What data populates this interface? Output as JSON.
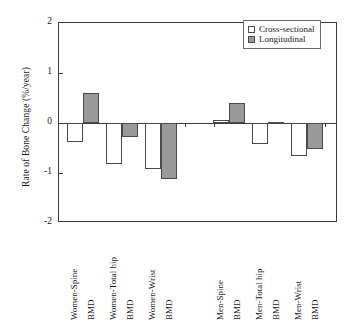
{
  "chart_data": {
    "type": "bar",
    "title": "",
    "xlabel": "",
    "ylabel": "Rate of Bone Change (%/year)",
    "ylim": [
      -2,
      2
    ],
    "yticks": [
      2,
      1,
      0,
      -1,
      -2
    ],
    "ytick_labels": [
      "2",
      "1",
      "0",
      "-1",
      "-2"
    ],
    "grid": false,
    "legend_position": "top-right",
    "categories": [
      "Women-Spine BMD",
      "Women-Total hip BMD",
      "Women-Wrist BMD",
      "Men-Spine BMD",
      "Men-Total hip BMD",
      "Men-Wrist BMD"
    ],
    "category_lines": [
      [
        "Women-Spine",
        "BMD"
      ],
      [
        "Women-Total hip",
        "BMD"
      ],
      [
        "Women-Wrist",
        "BMD"
      ],
      [
        "Men-Spine",
        "BMD"
      ],
      [
        "Men-Total hip",
        "BMD"
      ],
      [
        "Men-Wrist",
        "BMD"
      ]
    ],
    "series": [
      {
        "name": "Cross-sectional",
        "color": "#ffffff",
        "values": [
          -0.38,
          -0.82,
          -0.92,
          0.06,
          -0.42,
          -0.66
        ]
      },
      {
        "name": "Longitudinal",
        "color": "#999999",
        "values": [
          0.6,
          -0.27,
          -1.12,
          0.4,
          0.02,
          -0.51
        ]
      }
    ]
  },
  "legend": {
    "items": [
      {
        "label": "Cross-sectional",
        "swatch": "cross-sectional-swatch"
      },
      {
        "label": "Longitudinal",
        "swatch": "longitudinal-swatch"
      }
    ]
  }
}
